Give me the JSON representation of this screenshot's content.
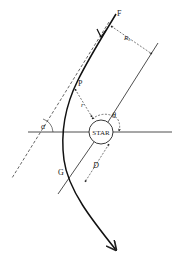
{
  "diagram": {
    "labels": {
      "start_point": "F",
      "periastron_point": "P",
      "crossing_point": "G",
      "star": "STAR",
      "impact_parameter": "R₀",
      "radius": "r",
      "true_anomaly": "θ",
      "asymptote_angle": "α",
      "distance": "D"
    },
    "colors": {
      "line": "#222222",
      "background": "#ffffff"
    }
  }
}
